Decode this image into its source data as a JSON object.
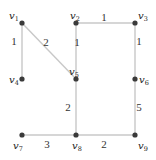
{
  "diagram": {
    "type": "weighted-undirected-graph",
    "nodes": [
      {
        "id": "v1",
        "label": "v",
        "sub": "1",
        "x": 22,
        "y": 23,
        "lx": 9,
        "ly": 19
      },
      {
        "id": "v2",
        "label": "v",
        "sub": "2",
        "x": 76,
        "y": 23,
        "lx": 70,
        "ly": 19
      },
      {
        "id": "v3",
        "label": "v",
        "sub": "3",
        "x": 135,
        "y": 23,
        "lx": 138,
        "ly": 19
      },
      {
        "id": "v4",
        "label": "v",
        "sub": "4",
        "x": 22,
        "y": 79,
        "lx": 9,
        "ly": 83
      },
      {
        "id": "v5",
        "label": "v",
        "sub": "5",
        "x": 76,
        "y": 79,
        "lx": 69,
        "ly": 75
      },
      {
        "id": "v6",
        "label": "v",
        "sub": "6",
        "x": 135,
        "y": 79,
        "lx": 139,
        "ly": 83
      },
      {
        "id": "v7",
        "label": "v",
        "sub": "7",
        "x": 22,
        "y": 135,
        "lx": 13,
        "ly": 149
      },
      {
        "id": "v8",
        "label": "v",
        "sub": "8",
        "x": 76,
        "y": 135,
        "lx": 72,
        "ly": 149
      },
      {
        "id": "v9",
        "label": "v",
        "sub": "9",
        "x": 135,
        "y": 135,
        "lx": 138,
        "ly": 149
      }
    ],
    "edges": [
      {
        "from": "v1",
        "to": "v4",
        "weight": "1",
        "wx": 14,
        "wy": 45
      },
      {
        "from": "v1",
        "to": "v5",
        "weight": "2",
        "wx": 46,
        "wy": 46
      },
      {
        "from": "v2",
        "to": "v5",
        "weight": "1",
        "wx": 77,
        "wy": 46
      },
      {
        "from": "v2",
        "to": "v3",
        "weight": "1",
        "wx": 104,
        "wy": 21
      },
      {
        "from": "v3",
        "to": "v6",
        "weight": "1",
        "wx": 139,
        "wy": 45
      },
      {
        "from": "v6",
        "to": "v9",
        "weight": "5",
        "wx": 139,
        "wy": 111
      },
      {
        "from": "v5",
        "to": "v8",
        "weight": "2",
        "wx": 68,
        "wy": 111
      },
      {
        "from": "v7",
        "to": "v8",
        "weight": "3",
        "wx": 47,
        "wy": 148
      },
      {
        "from": "v8",
        "to": "v9",
        "weight": "2",
        "wx": 104,
        "wy": 148
      }
    ],
    "colors": {
      "edge": "#c8c8c8",
      "node": "#3a3a3a",
      "text": "#222222",
      "background": "#ffffff"
    }
  }
}
